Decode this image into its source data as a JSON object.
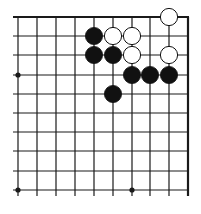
{
  "diagram": {
    "type": "go-board-fragment",
    "region": "top-right corner",
    "columns": 10,
    "rows": 10,
    "grid_x": [
      18,
      37,
      56,
      75,
      94,
      113,
      132,
      150,
      169,
      188
    ],
    "grid_y": [
      17,
      36,
      55,
      75,
      94,
      113,
      132,
      151,
      171,
      190
    ],
    "line_color": "#1a1a1a",
    "star_points": [
      [
        0,
        3
      ],
      [
        0,
        9
      ],
      [
        6,
        9
      ]
    ],
    "stones": [
      {
        "color": "white",
        "col": 8,
        "row": 0
      },
      {
        "color": "black",
        "col": 4,
        "row": 1
      },
      {
        "color": "white",
        "col": 5,
        "row": 1
      },
      {
        "color": "white",
        "col": 6,
        "row": 1
      },
      {
        "color": "black",
        "col": 4,
        "row": 2
      },
      {
        "color": "black",
        "col": 5,
        "row": 2
      },
      {
        "color": "white",
        "col": 6,
        "row": 2
      },
      {
        "color": "white",
        "col": 8,
        "row": 2
      },
      {
        "color": "black",
        "col": 6,
        "row": 3
      },
      {
        "color": "black",
        "col": 7,
        "row": 3
      },
      {
        "color": "black",
        "col": 8,
        "row": 3
      },
      {
        "color": "black",
        "col": 5,
        "row": 4
      }
    ],
    "stone_colors": {
      "black": "#111111",
      "white": "#ffffff"
    }
  }
}
